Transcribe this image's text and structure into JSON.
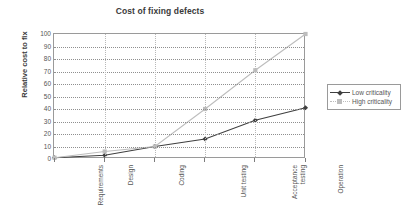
{
  "chart_data": {
    "type": "line",
    "title": "Cost of fixing defects",
    "xlabel": "",
    "ylabel": "Relative cost to fix",
    "ylim": [
      0,
      100
    ],
    "ytick_step": 10,
    "yticks": [
      0,
      10,
      20,
      30,
      40,
      50,
      60,
      70,
      80,
      90,
      100
    ],
    "grid": true,
    "legend_position": "right",
    "categories": [
      "Requirements",
      "Design",
      "Coding",
      "Unit testing",
      "Acceptance\ntesting",
      "Operation"
    ],
    "series": [
      {
        "name": "Low criticality",
        "color": "#3f3f3f",
        "marker": "diamond",
        "linestyle": "solid",
        "values": [
          1,
          3,
          10,
          16,
          31,
          41
        ]
      },
      {
        "name": "High criticality",
        "color": "#bdbdbd",
        "marker": "square",
        "linestyle": "solid",
        "values": [
          1,
          6,
          10,
          40,
          71,
          100
        ]
      }
    ]
  },
  "legend": {
    "items": [
      {
        "label": "Low criticality"
      },
      {
        "label": "High criticality"
      }
    ]
  },
  "colors": {
    "axis": "#9a9a9a",
    "grid": "#8f8f8f",
    "text": "#555555",
    "title": "#3a3a3a",
    "background": "#ffffff"
  }
}
